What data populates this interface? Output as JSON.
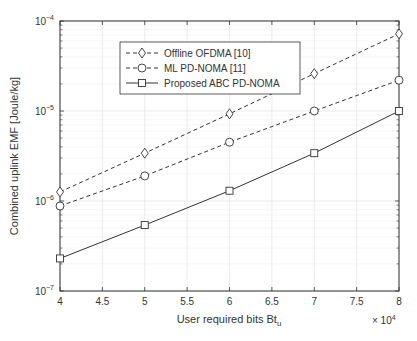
{
  "chart_data": {
    "type": "line",
    "title": "",
    "xlabel": "User required bits Bt_u",
    "xlabel_main": "User required bits Bt",
    "xlabel_sub": "u",
    "x_multiplier": "× 10",
    "x_multiplier_exp": "4",
    "ylabel": "Combined uplink EMF [Joule/kg]",
    "yscale": "log",
    "xlim": [
      4,
      8
    ],
    "ylim": [
      1e-07,
      0.0001
    ],
    "grid": true,
    "legend_position": "upper left (inset)",
    "x": [
      4,
      5,
      6,
      7,
      8
    ],
    "x_ticks": [
      "4",
      "4.5",
      "5",
      "5.5",
      "6",
      "6.5",
      "7",
      "7.5",
      "8"
    ],
    "y_ticks": [
      {
        "base": "10",
        "exp": "-4"
      },
      {
        "base": "10",
        "exp": "-5"
      },
      {
        "base": "10",
        "exp": "-6"
      },
      {
        "base": "10",
        "exp": "-7"
      }
    ],
    "series": [
      {
        "name": "Offline OFDMA [10]",
        "marker": "diamond",
        "line": "dashed",
        "values": [
          1.26e-06,
          3.4e-06,
          9.3e-06,
          2.6e-05,
          7.2e-05
        ]
      },
      {
        "name": "ML PD-NOMA [11]",
        "marker": "circle",
        "line": "dashed",
        "values": [
          8.8e-07,
          1.9e-06,
          4.5e-06,
          1e-05,
          2.2e-05
        ]
      },
      {
        "name": "Proposed ABC PD-NOMA",
        "marker": "square",
        "line": "solid",
        "values": [
          2.3e-07,
          5.4e-07,
          1.3e-06,
          3.4e-06,
          1e-05
        ]
      }
    ]
  }
}
